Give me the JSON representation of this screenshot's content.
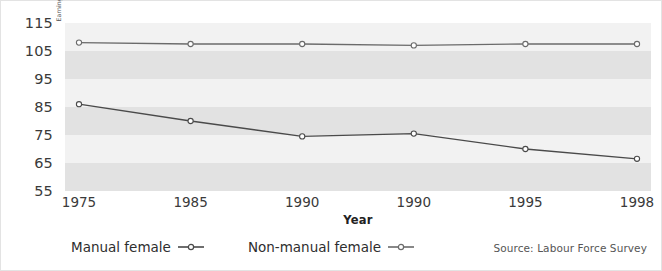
{
  "chart_data": {
    "type": "line",
    "title": "",
    "xlabel": "Year",
    "ylabel": "Earnings as a % of average female earnings",
    "categories": [
      "1975",
      "1985",
      "1990",
      "1990",
      "1995",
      "1998"
    ],
    "series": [
      {
        "name": "Non-manual female",
        "values": [
          108.0,
          107.5,
          107.5,
          107.0,
          107.5,
          107.5
        ],
        "color": "#6b6b6b",
        "marker": "open-circle"
      },
      {
        "name": "Manual female",
        "values": [
          86.0,
          80.0,
          74.5,
          75.5,
          70.0,
          66.5
        ],
        "color": "#4a4a4a",
        "marker": "open-circle"
      }
    ],
    "ylim": [
      55,
      115
    ],
    "yticks": [
      115,
      105,
      95,
      85,
      75,
      65,
      55
    ],
    "ytick_labels": [
      "115",
      "105",
      "95",
      "85",
      "75",
      "65",
      "55"
    ],
    "grid": "alternating-horizontal-bands",
    "legend_position": "bottom-left",
    "annotations": [
      "Source: Labour Force Survey"
    ]
  },
  "legend": {
    "entries": [
      {
        "label": "Manual female"
      },
      {
        "label": "Non-manual female"
      }
    ]
  },
  "source": {
    "text": "Source: Labour Force Survey"
  },
  "colors": {
    "band": "#e2e2e2",
    "band_light": "#f2f2f2",
    "line_upper": "#6b6b6b",
    "line_lower": "#4a4a4a",
    "text": "#3a3a3a",
    "background": "#ffffff"
  }
}
